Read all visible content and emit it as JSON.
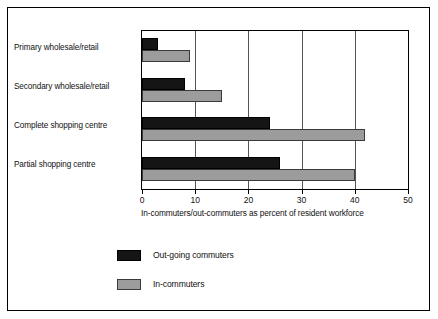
{
  "chart_data": {
    "type": "bar",
    "orientation": "horizontal",
    "title": "",
    "xlabel": "In-commuters/out-commuters as percent of resident workforce",
    "ylabel": "",
    "xlim": [
      0,
      50
    ],
    "xticks": [
      0,
      10,
      20,
      30,
      40,
      50
    ],
    "xtick_labels": [
      "0",
      "10",
      "20",
      "30",
      "40",
      "50"
    ],
    "grid": "vertical gridlines at each x tick",
    "legend_position": "below plot, left-of-center",
    "categories": [
      "Primary wholesale/retail",
      "Secondary wholesale/retail",
      "Complete shopping centre",
      "Partial shopping centre"
    ],
    "series": [
      {
        "name": "Out-going commuters",
        "color": "#151515",
        "values": [
          3,
          8,
          24,
          26
        ]
      },
      {
        "name": "In-commuters",
        "color": "#9c9c9c",
        "values": [
          9,
          15,
          42,
          40
        ]
      }
    ]
  },
  "axis": {
    "title": "In-commuters/out-commuters as percent of resident workforce",
    "ticks": [
      "0",
      "10",
      "20",
      "30",
      "40",
      "50"
    ]
  },
  "legend": {
    "items": [
      {
        "label": "Out-going commuters",
        "swatch": "#151515"
      },
      {
        "label": "In-commuters",
        "swatch": "#9c9c9c"
      }
    ]
  },
  "colors": {
    "out_going": "#151515",
    "in_commuters": "#9c9c9c",
    "frame": "#000000",
    "background": "#ffffff"
  }
}
